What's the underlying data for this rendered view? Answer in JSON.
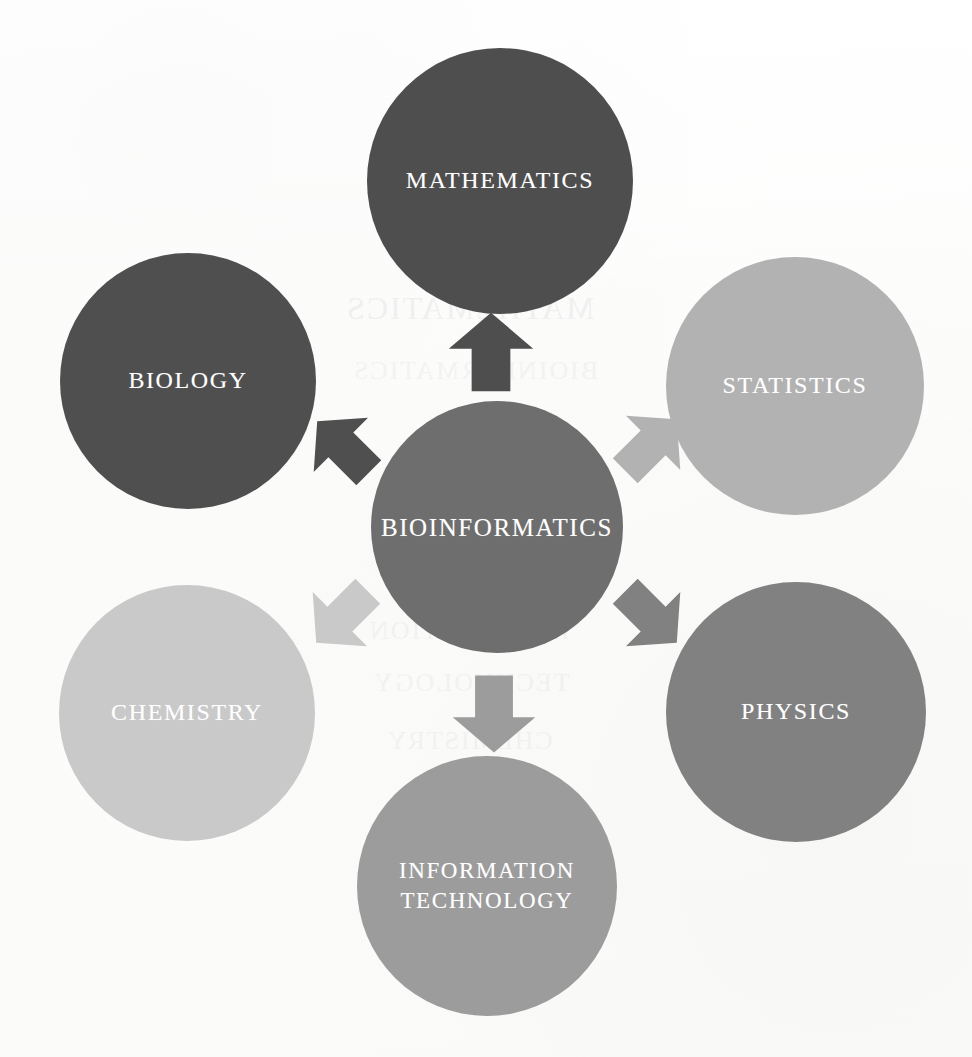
{
  "diagram": {
    "background_color": "#fdfdfc",
    "label_color": "#ffffff",
    "center": {
      "id": "bioinformatics",
      "label": "BIOINFORMATICS",
      "color": "#6e6e6e",
      "cx": 497,
      "cy": 527,
      "r": 126,
      "font_size": 25
    },
    "nodes": [
      {
        "id": "mathematics",
        "label": "MATHEMATICS",
        "color": "#4e4e4e",
        "cx": 500,
        "cy": 181,
        "r": 133,
        "font_size": 24,
        "direction": "up"
      },
      {
        "id": "biology",
        "label": "BIOLOGY",
        "color": "#4f4f4f",
        "cx": 188,
        "cy": 381,
        "r": 128,
        "font_size": 24,
        "direction": "up-left"
      },
      {
        "id": "statistics",
        "label": "STATISTICS",
        "color": "#b2b2b2",
        "cx": 795,
        "cy": 386,
        "r": 129,
        "font_size": 24,
        "direction": "up-right"
      },
      {
        "id": "chemistry",
        "label": "CHEMISTRY",
        "color": "#c9c9c9",
        "cx": 187,
        "cy": 713,
        "r": 128,
        "font_size": 24,
        "direction": "down-left"
      },
      {
        "id": "physics",
        "label": "PHYSICS",
        "color": "#818181",
        "cx": 796,
        "cy": 712,
        "r": 130,
        "font_size": 24,
        "direction": "down-right"
      },
      {
        "id": "information-technology",
        "label": "INFORMATION\nTECHNOLOGY",
        "color": "#9c9c9c",
        "cx": 487,
        "cy": 886,
        "r": 130,
        "font_size": 23,
        "direction": "down"
      }
    ],
    "arrows": [
      {
        "id": "arrow-to-mathematics",
        "points_to": "mathematics",
        "color": "#4e4e4e",
        "cx": 491,
        "cy": 352,
        "w": 88,
        "h": 82,
        "rotate": 0
      },
      {
        "id": "arrow-to-biology",
        "points_to": "biology",
        "color": "#4f4f4f",
        "cx": 343,
        "cy": 447,
        "w": 80,
        "h": 76,
        "rotate": -45
      },
      {
        "id": "arrow-to-statistics",
        "points_to": "statistics",
        "color": "#b2b2b2",
        "cx": 651,
        "cy": 445,
        "w": 80,
        "h": 76,
        "rotate": 45
      },
      {
        "id": "arrow-to-chemistry",
        "points_to": "chemistry",
        "color": "#c9c9c9",
        "cx": 342,
        "cy": 617,
        "w": 80,
        "h": 76,
        "rotate": -135
      },
      {
        "id": "arrow-to-physics",
        "points_to": "physics",
        "color": "#818181",
        "cx": 651,
        "cy": 617,
        "w": 80,
        "h": 76,
        "rotate": 135
      },
      {
        "id": "arrow-to-information-technology",
        "points_to": "information-technology",
        "color": "#9c9c9c",
        "cx": 494,
        "cy": 714,
        "w": 86,
        "h": 80,
        "rotate": 180
      }
    ],
    "ghost_marks": [
      {
        "text": "MATHEMATICS",
        "x": 345,
        "y": 290,
        "size": 32,
        "opacity": 0.045
      },
      {
        "text": "BIOINFORMATICS",
        "x": 352,
        "y": 356,
        "size": 26,
        "opacity": 0.032
      },
      {
        "text": "INFORMATION",
        "x": 368,
        "y": 616,
        "size": 26,
        "opacity": 0.03
      },
      {
        "text": "TECHNOLOGY",
        "x": 372,
        "y": 668,
        "size": 26,
        "opacity": 0.03
      },
      {
        "text": "CHEMISTRY",
        "x": 386,
        "y": 726,
        "size": 26,
        "opacity": 0.03
      }
    ]
  }
}
